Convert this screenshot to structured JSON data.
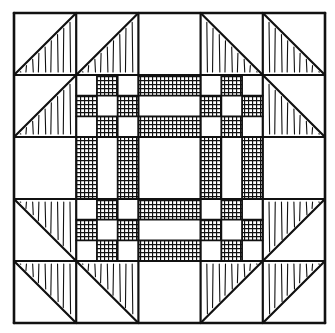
{
  "figure": {
    "grid": {
      "cols": 5,
      "rows": 5
    },
    "colors": {
      "background": "#ffffff",
      "ink": "#111111"
    },
    "corner_units": [
      {
        "pos": "top-left",
        "triangles": [
          {
            "cell": [
              0,
              0
            ],
            "shaded": "lower-right-diag-up"
          },
          {
            "cell": [
              1,
              0
            ],
            "shaded": "lower-right-diag-up"
          },
          {
            "cell": [
              0,
              1
            ],
            "shaded": "lower-right-diag-up"
          }
        ]
      },
      {
        "pos": "top-right",
        "triangles": [
          {
            "cell": [
              3,
              0
            ],
            "shaded": "lower-left-diag-down"
          },
          {
            "cell": [
              4,
              0
            ],
            "shaded": "lower-left-diag-down"
          },
          {
            "cell": [
              4,
              1
            ],
            "shaded": "lower-left-diag-down"
          }
        ]
      },
      {
        "pos": "bottom-left",
        "triangles": [
          {
            "cell": [
              0,
              3
            ],
            "shaded": "upper-right-diag-down"
          },
          {
            "cell": [
              0,
              4
            ],
            "shaded": "upper-right-diag-down"
          },
          {
            "cell": [
              1,
              4
            ],
            "shaded": "upper-right-diag-down"
          }
        ]
      },
      {
        "pos": "bottom-right",
        "triangles": [
          {
            "cell": [
              4,
              3
            ],
            "shaded": "upper-left-diag-up"
          },
          {
            "cell": [
              3,
              4
            ],
            "shaded": "upper-left-diag-up"
          },
          {
            "cell": [
              4,
              4
            ],
            "shaded": "upper-left-diag-up"
          }
        ]
      }
    ],
    "nine_patches": [
      [
        1,
        1
      ],
      [
        3,
        1
      ],
      [
        1,
        3
      ],
      [
        3,
        3
      ]
    ],
    "bars": [
      {
        "cell": [
          2,
          1
        ],
        "orientation": "horizontal"
      },
      {
        "cell": [
          2,
          3
        ],
        "orientation": "horizontal"
      },
      {
        "cell": [
          1,
          2
        ],
        "orientation": "vertical"
      },
      {
        "cell": [
          3,
          2
        ],
        "orientation": "vertical"
      }
    ]
  }
}
